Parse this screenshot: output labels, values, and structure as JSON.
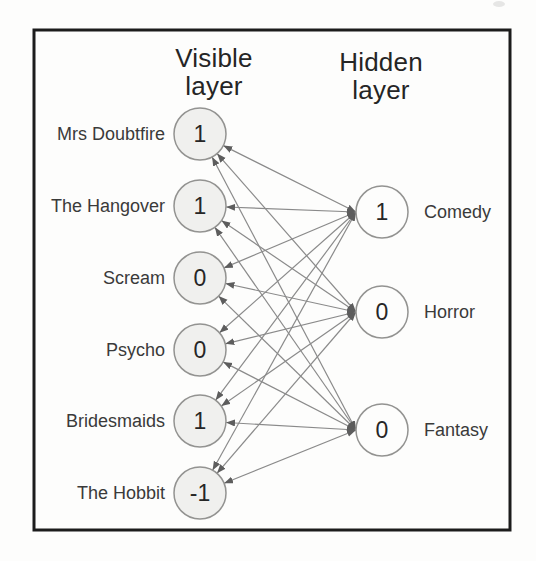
{
  "figure": {
    "type": "restricted-boltzmann-machine-diagram",
    "visible_layer": {
      "title": "Visible layer",
      "nodes": [
        {
          "label": "Mrs Doubtfire",
          "value": "1"
        },
        {
          "label": "The Hangover",
          "value": "1"
        },
        {
          "label": "Scream",
          "value": "0"
        },
        {
          "label": "Psycho",
          "value": "0"
        },
        {
          "label": "Bridesmaids",
          "value": "1"
        },
        {
          "label": "The Hobbit",
          "value": "-1"
        }
      ]
    },
    "hidden_layer": {
      "title": "Hidden layer",
      "nodes": [
        {
          "label": "Comedy",
          "value": "1"
        },
        {
          "label": "Horror",
          "value": "0"
        },
        {
          "label": "Fantasy",
          "value": "0"
        }
      ]
    },
    "connections": "every visible node connects to every hidden node with a double-headed arrow",
    "colors": {
      "frame": "#1c1c1c",
      "paper": "#fdfdfc",
      "visible_node_fill": "#f0f0ee",
      "hidden_node_fill": "#fdfdfc",
      "node_stroke": "#939391",
      "edge": "#8a8a8a",
      "arrowhead": "#5d5d5d",
      "text": "#2a2a2a"
    }
  }
}
